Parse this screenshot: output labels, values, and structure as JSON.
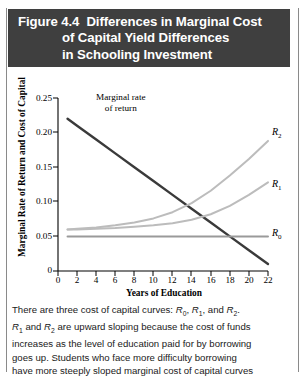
{
  "header": {
    "figure_number": "Figure 4.4",
    "title_lines": [
      "Differences in Marginal Cost",
      "of Capital Yield Differences",
      "in Schooling Investment"
    ],
    "background_color": "#3f3f3f",
    "text_color": "#ffffff"
  },
  "annotations": {
    "mrr_line1": "Marginal rate",
    "mrr_line2": "of return"
  },
  "caption": {
    "lines": [
      "There are three cost of capital curves: R₀, R₁, and R₂.",
      "R₁ and R₂ are upward sloping because the cost of funds",
      "increases as the level of education paid for by borrowing",
      "goes up. Students who face more difficulty borrowing",
      "have more steeply sloped marginal cost of capital curves"
    ]
  },
  "chart_data": {
    "type": "line",
    "title": "Differences in Marginal Cost of Capital Yield Differences in Schooling Investment",
    "xlabel": "Years of Education",
    "ylabel": "Marginal Rate of Return and Cost of Capital",
    "xlim": [
      0,
      22
    ],
    "ylim": [
      0,
      0.25
    ],
    "xticks": [
      0,
      2,
      4,
      6,
      8,
      10,
      12,
      14,
      16,
      18,
      20,
      22
    ],
    "xtick_labels": [
      "0",
      "2",
      "4",
      "6",
      "8",
      "10",
      "12",
      "14",
      "16",
      "18",
      "20",
      "22"
    ],
    "yticks": [
      0,
      0.05,
      0.1,
      0.15,
      0.2,
      0.25
    ],
    "ytick_labels": [
      "0",
      "0.05",
      "0.10",
      "0.15",
      "0.20",
      "0.25"
    ],
    "grid": false,
    "legend": "none (curves labeled at right end)",
    "x": [
      1,
      2,
      4,
      6,
      8,
      10,
      12,
      14,
      16,
      18,
      20,
      22
    ],
    "series": [
      {
        "name": "Marginal rate of return",
        "label": "Marginal rate of return",
        "color": "#3a3a3a",
        "width": 2.4,
        "style": "straight descending line",
        "values": [
          0.22,
          0.21,
          0.19,
          0.17,
          0.15,
          0.13,
          0.11,
          0.09,
          0.07,
          0.05,
          0.03,
          0.01
        ]
      },
      {
        "name": "R0",
        "label": "R₀",
        "color": "#9a9a9a",
        "width": 2.0,
        "style": "horizontal flat line",
        "values": [
          0.05,
          0.05,
          0.05,
          0.05,
          0.05,
          0.05,
          0.05,
          0.05,
          0.05,
          0.05,
          0.05,
          0.05
        ]
      },
      {
        "name": "R1",
        "label": "R₁",
        "color": "#bcbcbc",
        "width": 2.0,
        "style": "upward sloping convex curve",
        "values": [
          0.06,
          0.06,
          0.061,
          0.062,
          0.064,
          0.066,
          0.069,
          0.074,
          0.082,
          0.094,
          0.11,
          0.128
        ]
      },
      {
        "name": "R2",
        "label": "R₂",
        "color": "#bcbcbc",
        "width": 2.0,
        "style": "upward sloping steeply convex curve",
        "values": [
          0.06,
          0.061,
          0.063,
          0.066,
          0.07,
          0.076,
          0.085,
          0.098,
          0.116,
          0.138,
          0.162,
          0.188
        ]
      }
    ],
    "curve_end_labels": [
      {
        "label": "R₂",
        "x": 22,
        "y": 0.188
      },
      {
        "label": "R₁",
        "x": 22,
        "y": 0.128
      },
      {
        "label": "R₀",
        "x": 22,
        "y": 0.05
      }
    ]
  }
}
